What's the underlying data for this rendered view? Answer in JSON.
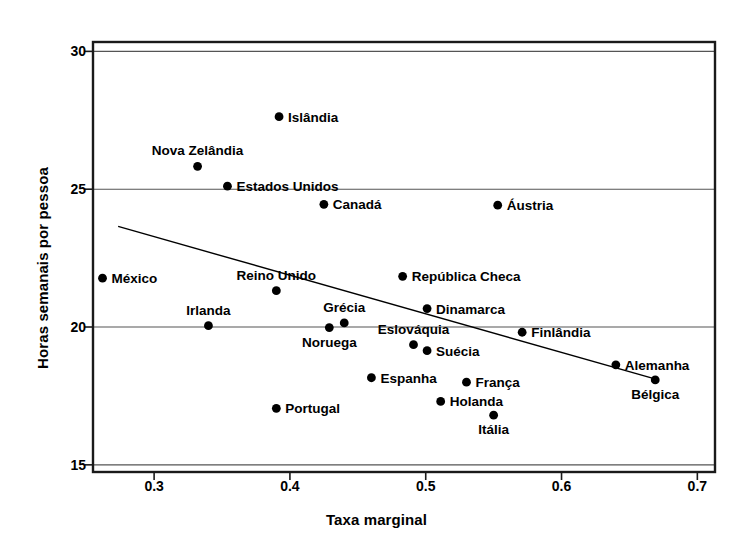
{
  "chart_data": {
    "type": "scatter",
    "title": "",
    "xlabel": "Taxa marginal",
    "ylabel": "Horas semanais por pessoa",
    "xlim": [
      0.255,
      0.713
    ],
    "ylim": [
      14.74,
      30.34
    ],
    "xticks": [
      0.3,
      0.4,
      0.5,
      0.6,
      0.7
    ],
    "xtick_labels": [
      "0.3",
      "0.4",
      "0.5",
      "0.6",
      "0.7"
    ],
    "yticks": [
      15,
      20,
      25,
      30
    ],
    "ytick_labels": [
      "15",
      "20",
      "25",
      "30"
    ],
    "grid": "horizontal",
    "legend": "none",
    "marker_color": "#000000",
    "line_color": "#000000",
    "frame_color": "#1a1a1a",
    "grid_color": "#555555",
    "trendline": {
      "name": "regressao-linear",
      "x": [
        0.2735,
        0.67
      ],
      "y": [
        23.65,
        18.1
      ]
    },
    "points": [
      {
        "name": "Islandia",
        "label": "Islândia",
        "x": 0.392,
        "y": 27.63,
        "label_pos": "right"
      },
      {
        "name": "Nova-Zelandia",
        "label": "Nova Zelândia",
        "x": 0.332,
        "y": 25.83,
        "label_pos": "above"
      },
      {
        "name": "Estados-Unidos",
        "label": "Estados Unidos",
        "x": 0.354,
        "y": 25.11,
        "label_pos": "right"
      },
      {
        "name": "Canada",
        "label": "Canadá",
        "x": 0.425,
        "y": 24.45,
        "label_pos": "right"
      },
      {
        "name": "Austria",
        "label": "Áustria",
        "x": 0.553,
        "y": 24.42,
        "label_pos": "right"
      },
      {
        "name": "Mexico",
        "label": "México",
        "x": 0.262,
        "y": 21.77,
        "label_pos": "right"
      },
      {
        "name": "Republica-Checa",
        "label": "República Checa",
        "x": 0.483,
        "y": 21.84,
        "label_pos": "right"
      },
      {
        "name": "Reino-Unido",
        "label": "Reino Unido",
        "x": 0.39,
        "y": 21.32,
        "label_pos": "above"
      },
      {
        "name": "Dinamarca",
        "label": "Dinamarca",
        "x": 0.501,
        "y": 20.67,
        "label_pos": "right"
      },
      {
        "name": "Grecia",
        "label": "Grécia",
        "x": 0.44,
        "y": 20.15,
        "label_pos": "above"
      },
      {
        "name": "Irlanda",
        "label": "Irlanda",
        "x": 0.34,
        "y": 20.05,
        "label_pos": "above"
      },
      {
        "name": "Noruega",
        "label": "Noruega",
        "x": 0.429,
        "y": 19.98,
        "label_pos": "below"
      },
      {
        "name": "Finlandia",
        "label": "Finlândia",
        "x": 0.571,
        "y": 19.81,
        "label_pos": "right"
      },
      {
        "name": "Eslovaquia",
        "label": "Eslováquia",
        "x": 0.491,
        "y": 19.36,
        "label_pos": "above"
      },
      {
        "name": "Suecia",
        "label": "Suécia",
        "x": 0.501,
        "y": 19.14,
        "label_pos": "right"
      },
      {
        "name": "Alemanha",
        "label": "Alemanha",
        "x": 0.64,
        "y": 18.63,
        "label_pos": "right"
      },
      {
        "name": "Espanha",
        "label": "Espanha",
        "x": 0.46,
        "y": 18.16,
        "label_pos": "right"
      },
      {
        "name": "Belgica",
        "label": "Bélgica",
        "x": 0.669,
        "y": 18.08,
        "label_pos": "below"
      },
      {
        "name": "Franca",
        "label": "França",
        "x": 0.53,
        "y": 18.0,
        "label_pos": "right"
      },
      {
        "name": "Holanda",
        "label": "Holanda",
        "x": 0.511,
        "y": 17.3,
        "label_pos": "right"
      },
      {
        "name": "Italia",
        "label": "Itália",
        "x": 0.55,
        "y": 16.8,
        "label_pos": "below"
      },
      {
        "name": "Portugal",
        "label": "Portugal",
        "x": 0.39,
        "y": 17.05,
        "label_pos": "right"
      }
    ]
  }
}
